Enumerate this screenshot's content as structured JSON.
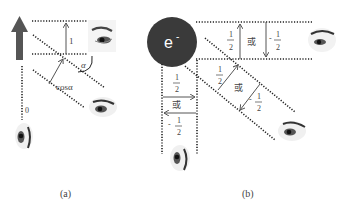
{
  "panel_a": {
    "caption": "(a)",
    "labels": {
      "one": "1",
      "alpha": "α",
      "cos_alpha": "cosα",
      "zero": "0"
    }
  },
  "panel_b": {
    "caption": "(b)",
    "electron": "e",
    "electron_sup": "-",
    "labels": {
      "half_num": "1",
      "half_den": "2",
      "neg_sign": "-",
      "or": "或"
    }
  },
  "colors": {
    "arrow": "#555555",
    "electron_fill": "#3a3a3a",
    "dots": "#222222"
  }
}
